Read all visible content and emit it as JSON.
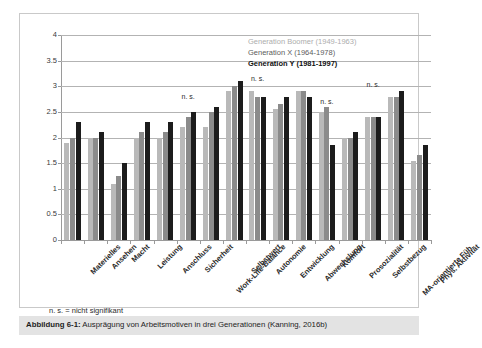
{
  "legend": {
    "entries": [
      {
        "label": "Generation Boomer (1949-1963)",
        "color": "#b9b9b9"
      },
      {
        "label": "Generation X (1964-1978)",
        "color": "#8b8b8b"
      },
      {
        "label": "Generation Y (1981-1997)",
        "color": "#1c1c1c"
      }
    ]
  },
  "footnote": "n. s. = nicht signifikant",
  "caption": {
    "prefix": "Abbildung 6-1:",
    "text": " Ausprägung von Arbeitsmotiven in drei Generationen (Kanning, 2016b)"
  },
  "chart_data": {
    "type": "bar",
    "title": "",
    "xlabel": "",
    "ylabel": "",
    "ylim": [
      0,
      4
    ],
    "yticks": [
      0,
      0.5,
      1,
      1.5,
      2,
      2.5,
      3,
      3.5,
      4
    ],
    "ytick_labels": [
      "0",
      "0.5",
      "1",
      "1.5",
      "2",
      "2.5",
      "3",
      "3.5",
      "4"
    ],
    "grid": true,
    "legend_position": "top-right",
    "categories": [
      "Materielles",
      "Ansehen",
      "Macht",
      "Leistung",
      "Anschluss",
      "Sicherheit",
      "Work-Life-Balance",
      "Selbstwert",
      "Autonomie",
      "Entwicklung",
      "Abwechslung",
      "Komfort",
      "Prosozialität",
      "Selbstbezug",
      "MA-orientierte Füh.",
      "Phys. Aktivität"
    ],
    "series": [
      {
        "name": "Generation Boomer (1949-1963)",
        "color": "#b9b9b9",
        "values": [
          1.9,
          2.0,
          1.1,
          2.0,
          2.0,
          2.2,
          2.2,
          2.9,
          2.9,
          2.55,
          2.9,
          2.5,
          2.0,
          2.4,
          2.8,
          1.55
        ]
      },
      {
        "name": "Generation X (1964-1978)",
        "color": "#8b8b8b",
        "values": [
          2.0,
          2.0,
          1.25,
          2.1,
          2.1,
          2.4,
          2.5,
          3.0,
          2.8,
          2.65,
          2.9,
          2.6,
          2.0,
          2.4,
          2.8,
          1.65
        ]
      },
      {
        "name": "Generation Y (1981-1997)",
        "color": "#1c1c1c",
        "values": [
          2.3,
          2.1,
          1.5,
          2.3,
          2.3,
          2.5,
          2.6,
          3.1,
          2.8,
          2.8,
          2.8,
          1.85,
          2.1,
          2.4,
          2.9,
          1.85
        ]
      }
    ],
    "annotations": [
      {
        "text": "n. s.",
        "category": "Sicherheit",
        "y": 2.72
      },
      {
        "text": "n. s.",
        "category": "Autonomie",
        "y": 3.06
      },
      {
        "text": "n. s.",
        "category": "Komfort",
        "y": 2.62
      },
      {
        "text": "n. s.",
        "category": "Selbstbezug",
        "y": 2.95
      }
    ]
  }
}
